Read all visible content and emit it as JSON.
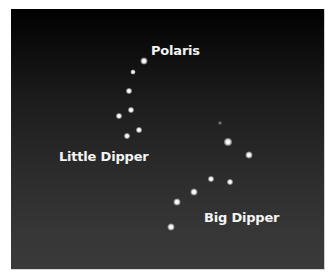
{
  "labels": {
    "polaris": "Polaris",
    "little_dipper": "Little Dipper",
    "big_dipper": "Big Dipper"
  },
  "colors": {
    "sky_top": "#000000",
    "sky_bottom": "#3a3a3a",
    "star": "#ffffff",
    "label_text": "#f4f4f4",
    "page_background": "#ffffff"
  }
}
